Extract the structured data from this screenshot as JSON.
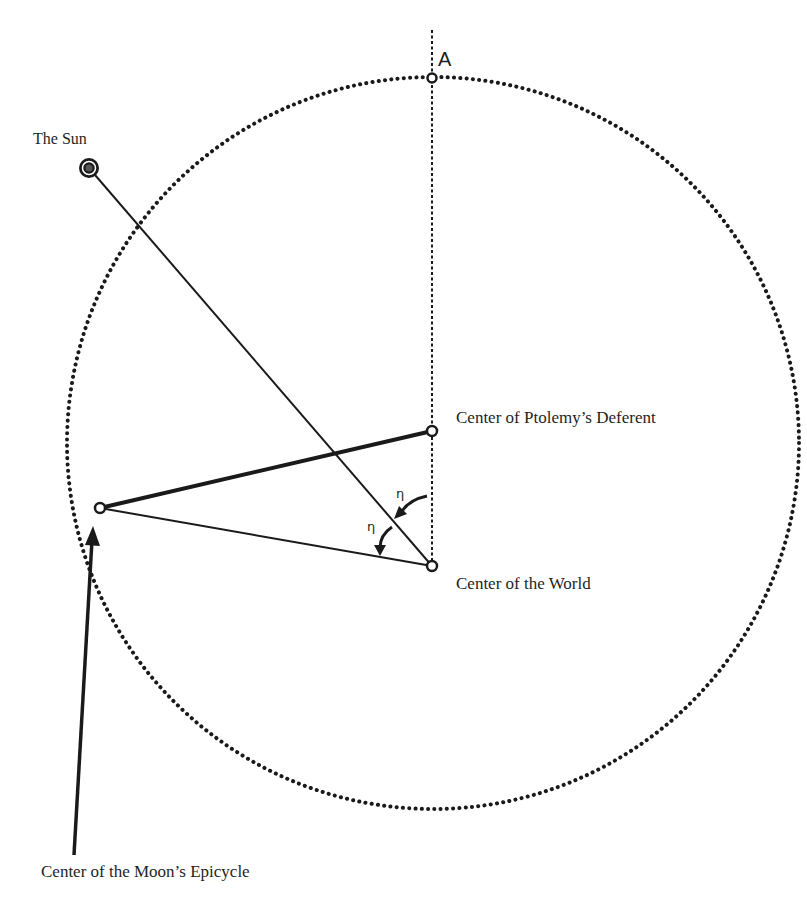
{
  "diagram": {
    "title": "",
    "labels": {
      "point_a": "A",
      "sun": "The Sun",
      "deferent_center": "Center of Ptolemy’s Deferent",
      "world_center": "Center of the World",
      "epicycle_center": "Center of the Moon’s Epicycle",
      "angle_1": "η",
      "angle_2": "η"
    },
    "points": {
      "A": {
        "x": 432,
        "y": 78
      },
      "sun": {
        "x": 89,
        "y": 168
      },
      "deferent_center": {
        "x": 432,
        "y": 431
      },
      "world_center": {
        "x": 432,
        "y": 566
      },
      "epicycle_center": {
        "x": 100,
        "y": 508
      }
    },
    "deferent_circle": {
      "cx": 433,
      "cy": 443,
      "r": 366,
      "style": "dotted"
    },
    "colors": {
      "ink": "#1a1a1a",
      "background": "#ffffff"
    }
  }
}
